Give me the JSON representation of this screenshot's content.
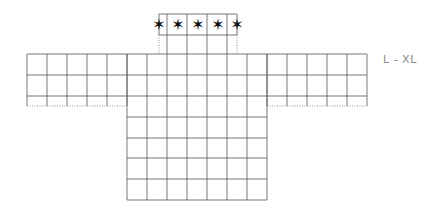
{
  "diagram": {
    "type": "knitting-chart",
    "size_label": "L - XL",
    "grid_color": "#555555",
    "dotted_color": "#777777",
    "star_color": "#111111",
    "star_symbol": "★",
    "star_count": 5,
    "sections": {
      "neck": {
        "rows": 1,
        "cells_with_stars": 5
      },
      "sleeves_left": {
        "columns": 5,
        "rows": 3
      },
      "sleeves_right": {
        "columns": 5,
        "rows": 3
      },
      "body": {
        "columns": 7,
        "rows": 7
      }
    }
  }
}
